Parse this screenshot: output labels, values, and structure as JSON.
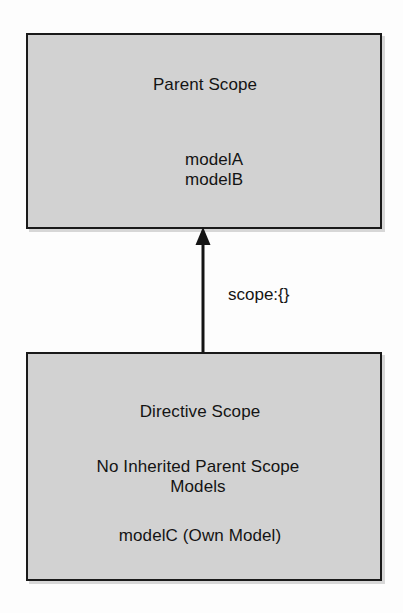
{
  "diagram": {
    "type": "flow-diagram",
    "background_color": "#fdfdfd",
    "box_fill_color": "#d2d2d2",
    "box_border_color": "#1a1a1a",
    "text_color": "#141414",
    "parent_scope": {
      "title": "Parent Scope",
      "models": [
        "modelA",
        "modelB"
      ]
    },
    "directive_scope": {
      "title": "Directive Scope",
      "note_line_1": "No Inherited Parent Scope",
      "note_line_2": "Models",
      "own_model": "modelC (Own Model)"
    },
    "connector": {
      "label": "scope:{}",
      "direction": "up",
      "from": "directive_scope",
      "to": "parent_scope",
      "arrow_color": "#141414"
    }
  }
}
